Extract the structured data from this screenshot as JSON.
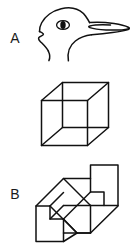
{
  "figure": {
    "background_color": "#ffffff",
    "ink_color": "#111111",
    "width": 132,
    "height": 250,
    "panels": [
      {
        "label": "A",
        "name": "rabbit-duck-illusion",
        "caption": "rabbit-duck ambiguous head figure",
        "elements": [
          "head outline",
          "eye ellipse",
          "pupil",
          "upper ear-bill prong",
          "lower ear-bill prong",
          "neck curve",
          "chin curve"
        ]
      },
      {
        "label": "B",
        "name": "necker-cube",
        "caption": "Necker cube wireframe",
        "elements": [
          "front square",
          "back square",
          "four connecting edges"
        ]
      },
      {
        "label": "C",
        "name": "schroder-stairs",
        "caption": "Schroeder staircase figure",
        "elements": [
          "outer outline",
          "two step treads",
          "two step risers",
          "left step profile",
          "right step profile"
        ]
      }
    ]
  },
  "labels": {
    "a": "A",
    "b": "B",
    "c": "C"
  }
}
